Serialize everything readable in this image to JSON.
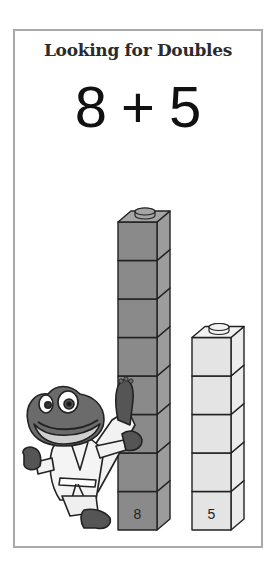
{
  "card": {
    "title": "Looking for Doubles",
    "equation": {
      "left": "8",
      "operator": "+",
      "right": "5"
    }
  },
  "towers": [
    {
      "name": "dark-tower",
      "count": 8,
      "label": "8",
      "front_color": "#8a8a8a",
      "side_color": "#9c9c9c",
      "top_color": "#a5a5a5"
    },
    {
      "name": "light-tower",
      "count": 5,
      "label": "5",
      "front_color": "#e4e4e4",
      "side_color": "#ececec",
      "top_color": "#f1f1f1"
    }
  ],
  "character": {
    "icon": "karate-frog-icon"
  }
}
